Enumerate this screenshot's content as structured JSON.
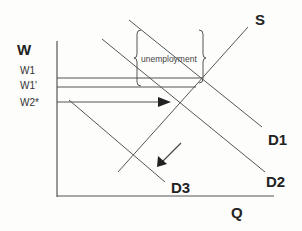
{
  "diagram": {
    "type": "supply-demand labor market",
    "axes": {
      "y_label": "W",
      "x_label": "Q",
      "y_ticks": [
        "W1",
        "W1'",
        "W2*"
      ]
    },
    "curves": {
      "supply": "S",
      "demand": [
        "D1",
        "D2",
        "D3"
      ]
    },
    "annotations": {
      "brace_label": "unemployment"
    },
    "colors": {
      "line": "#555555",
      "text": "#222222",
      "background": "#fdfdfb"
    }
  }
}
